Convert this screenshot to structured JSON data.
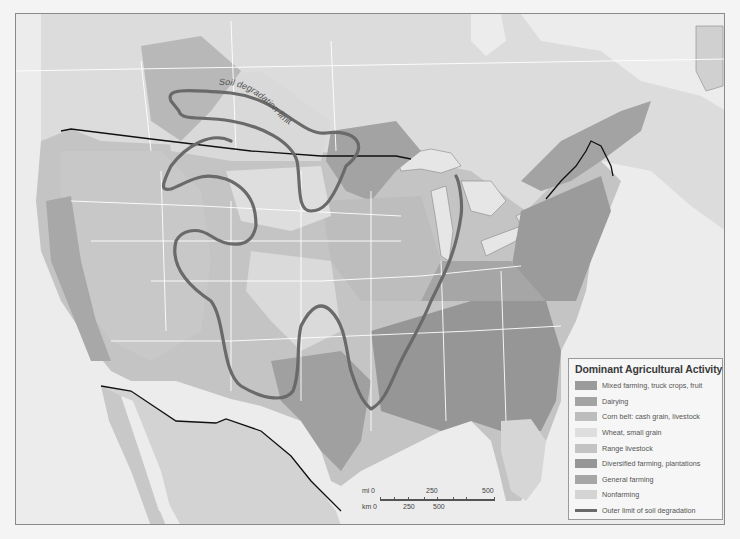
{
  "map": {
    "curve_label": "Soil degradation limit",
    "colors": {
      "water": "#ececec",
      "land_base": "#d2d2d2",
      "canada_light": "#dcdcdc",
      "border_line": "#111111",
      "state_line": "#ffffff",
      "degradation_line": "#6a6a6a"
    }
  },
  "legend": {
    "title": "Dominant Agricultural Activity",
    "items": [
      {
        "label": "Mixed farming, truck crops, fruit",
        "color": "#9b9b9b"
      },
      {
        "label": "Dairying",
        "color": "#a3a3a3"
      },
      {
        "label": "Corn belt: cash grain, livestock",
        "color": "#bdbdbd"
      },
      {
        "label": "Wheat, small grain",
        "color": "#dedede"
      },
      {
        "label": "Range livestock",
        "color": "#c3c3c3"
      },
      {
        "label": "Diversified farming, plantations",
        "color": "#969696"
      },
      {
        "label": "General farming",
        "color": "#a6a6a6"
      },
      {
        "label": "Nonfarming",
        "color": "#d4d4d4"
      }
    ],
    "line_item": {
      "label": "Outer limit of soil degradation",
      "color": "#6a6a6a"
    }
  },
  "scale": {
    "mi_label": "mi",
    "km_label": "km",
    "mi_ticks": [
      "0",
      "250",
      "500"
    ],
    "km_ticks": [
      "0",
      "250",
      "500"
    ]
  }
}
